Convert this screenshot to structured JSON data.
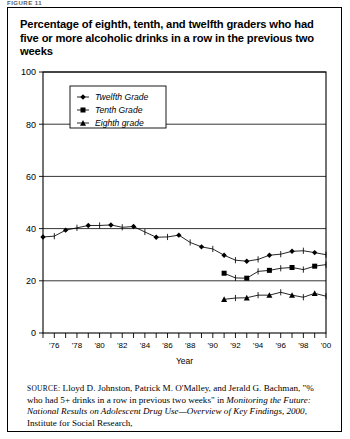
{
  "figure_label": "FIGURE 11",
  "title": "Percentage of eighth, tenth, and twelfth graders who had five or more alcoholic drinks in a row in the previous two weeks",
  "source": {
    "label": "SOURCE:",
    "text_1": " Lloyd D. Johnston, Patrick M. O'Malley, and Jerald G. Bachman, \"% who had 5+ drinks in a row in previous two weeks\" in ",
    "italic_1": "Monitoring the Future: National Results on Adolescent Drug Use—Overview of Key Findings, 2000",
    "text_2": ", Institute for Social Research,"
  },
  "chart_data": {
    "type": "line",
    "title": "",
    "xlabel": "Year",
    "ylabel": "",
    "ylim": [
      0,
      100
    ],
    "yticks": [
      0,
      20,
      40,
      60,
      80,
      100
    ],
    "ytick_labels": [
      "0",
      "20",
      "40",
      "60",
      "80",
      "100"
    ],
    "xlim": [
      1975,
      2000
    ],
    "xticks": [
      1975,
      1976,
      1977,
      1978,
      1979,
      1980,
      1981,
      1982,
      1983,
      1984,
      1985,
      1986,
      1987,
      1988,
      1989,
      1990,
      1991,
      1992,
      1993,
      1994,
      1995,
      1996,
      1997,
      1998,
      1999,
      2000
    ],
    "xtick_labels": [
      "",
      "'76",
      "",
      "'78",
      "",
      "'80",
      "",
      "'82",
      "",
      "'84",
      "",
      "'86",
      "",
      "'88",
      "",
      "'90",
      "",
      "'92",
      "",
      "'94",
      "",
      "'96",
      "",
      "'98",
      "",
      "'00"
    ],
    "grid": true,
    "grid_axis": "y",
    "legend_position": "upper-left",
    "series": [
      {
        "name": "Twelfth Grade",
        "marker": "diamond",
        "x": [
          1975,
          1976,
          1977,
          1978,
          1979,
          1980,
          1981,
          1982,
          1983,
          1984,
          1985,
          1986,
          1987,
          1988,
          1989,
          1990,
          1991,
          1992,
          1993,
          1994,
          1995,
          1996,
          1997,
          1998,
          1999,
          2000
        ],
        "values": [
          36.8,
          37.1,
          39.4,
          40.3,
          41.2,
          41.2,
          41.4,
          40.5,
          40.8,
          38.7,
          36.7,
          36.8,
          37.5,
          34.7,
          33.0,
          32.2,
          29.8,
          27.9,
          27.5,
          28.2,
          29.8,
          30.2,
          31.3,
          31.5,
          30.8,
          30.0
        ]
      },
      {
        "name": "Tenth Grade",
        "marker": "square",
        "x": [
          1991,
          1992,
          1993,
          1994,
          1995,
          1996,
          1997,
          1998,
          1999,
          2000
        ],
        "values": [
          22.9,
          21.1,
          21.0,
          23.6,
          24.0,
          24.8,
          25.1,
          24.3,
          25.6,
          26.2
        ]
      },
      {
        "name": "Eighth grade",
        "marker": "triangle",
        "x": [
          1991,
          1992,
          1993,
          1994,
          1995,
          1996,
          1997,
          1998,
          1999,
          2000
        ],
        "values": [
          12.9,
          13.4,
          13.5,
          14.5,
          14.5,
          15.6,
          14.5,
          13.7,
          15.2,
          14.1
        ]
      }
    ]
  }
}
